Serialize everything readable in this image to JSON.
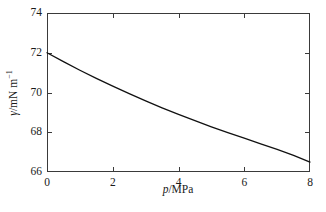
{
  "chart_data": {
    "type": "line",
    "title": "",
    "subtitle": "",
    "xlabel": "p/MPa",
    "ylabel": "γ/mN m⁻¹",
    "xlabel_parts": {
      "symbol": "p",
      "rest": "/MPa"
    },
    "ylabel_parts": {
      "symbol": "γ",
      "rest": "/mN m",
      "exponent": "−1"
    },
    "xlim": [
      0,
      8
    ],
    "ylim": [
      66,
      74
    ],
    "xticks": [
      0,
      2,
      4,
      6,
      8
    ],
    "yticks": [
      66,
      68,
      70,
      72,
      74
    ],
    "xtick_labels": [
      "0",
      "2",
      "4",
      "6",
      "8"
    ],
    "ytick_labels": [
      "66",
      "68",
      "70",
      "72",
      "74"
    ],
    "grid": false,
    "legend": null,
    "legend_position": "none",
    "tick_direction": "in",
    "frame": "full-box",
    "series": [
      {
        "name": "surface tension vs pressure",
        "color": "#111111",
        "line_width": 1.3,
        "marker": "none",
        "x": [
          0.0,
          0.5,
          1.0,
          1.5,
          2.0,
          2.5,
          3.0,
          3.5,
          4.0,
          4.5,
          5.0,
          5.5,
          6.0,
          6.5,
          7.0,
          7.5,
          8.0
        ],
        "y": [
          72.0,
          71.55,
          71.12,
          70.71,
          70.32,
          69.94,
          69.58,
          69.23,
          68.9,
          68.58,
          68.27,
          67.98,
          67.7,
          67.42,
          67.14,
          66.84,
          66.5
        ]
      }
    ]
  },
  "colors": {
    "background": "#ffffff",
    "axis": "#3a3a3a",
    "line": "#111111",
    "text": "#1a1a1a"
  },
  "geometry": {
    "plot_left": 47,
    "plot_right": 310,
    "plot_top": 13,
    "plot_bottom": 172
  }
}
